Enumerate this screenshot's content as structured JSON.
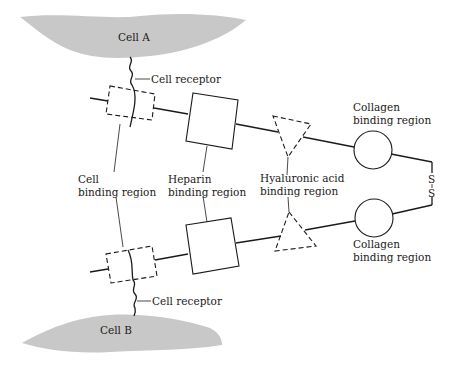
{
  "diagram": {
    "cells": [
      {
        "label": "Cell A"
      },
      {
        "label": "Cell B"
      }
    ],
    "labels": {
      "cell_receptor_top": "Cell receptor",
      "cell_receptor_bottom": "Cell receptor",
      "cell_binding_line1": "Cell",
      "cell_binding_line2": "binding region",
      "heparin_line1": "Heparin",
      "heparin_line2": "binding region",
      "hyaluronic_line1": "Hyaluronic acid",
      "hyaluronic_line2": "binding region",
      "collagen_top_line1": "Collagen",
      "collagen_top_line2": "binding region",
      "collagen_bottom_line1": "Collagen",
      "collagen_bottom_line2": "binding region",
      "disulfide_s1": "S",
      "disulfide_s2": "S"
    },
    "colors": {
      "cell_fill": "#c8c8c8",
      "stroke": "#1a1a1a"
    }
  }
}
